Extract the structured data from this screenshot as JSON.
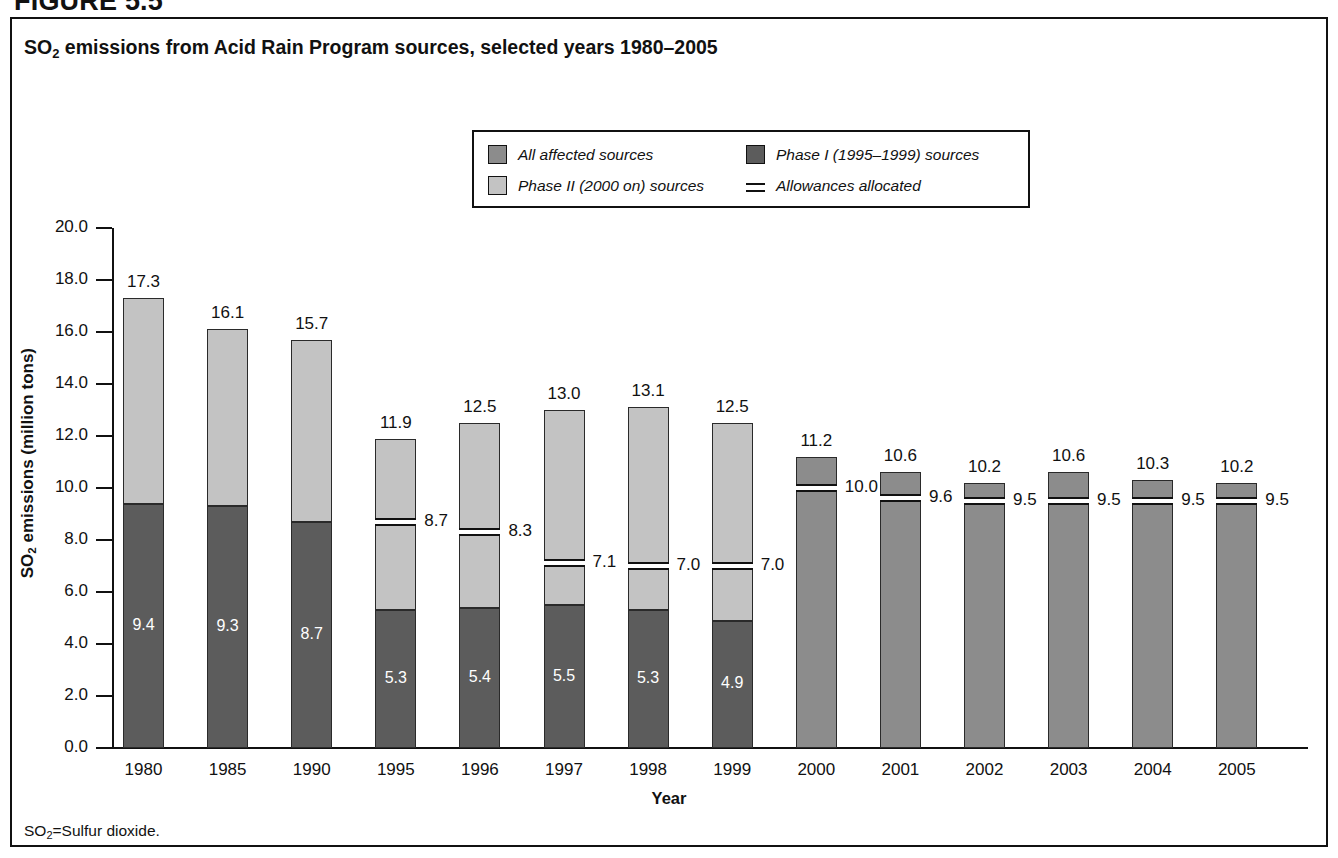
{
  "figure": {
    "number": "FIGURE 5.5"
  },
  "title": {
    "pre": "SO",
    "sub": "2",
    "post": " emissions from Acid Rain Program sources, selected years 1980–2005"
  },
  "legend": {
    "items": [
      {
        "label": "All affected sources",
        "marker": "swatch",
        "color": "#8c8c8c"
      },
      {
        "label": "Phase I (1995–1999) sources",
        "marker": "swatch",
        "color": "#5c5c5c"
      },
      {
        "label": "Phase II (2000 on) sources",
        "marker": "swatch",
        "color": "#c3c3c3"
      },
      {
        "label": "Allowances allocated",
        "marker": "line",
        "color": "#111111"
      }
    ]
  },
  "footnote": {
    "pre": "SO",
    "sub": "2",
    "post": "=Sulfur dioxide."
  },
  "chart_data": {
    "type": "bar",
    "title": "SO2 emissions from Acid Rain Program sources, selected years 1980–2005",
    "xlabel": "Year",
    "ylabel": "SO2 emissions (million tons)",
    "ylim": [
      0.0,
      20.0
    ],
    "ytick_step": 2.0,
    "yticks": [
      "0.0",
      "2.0",
      "4.0",
      "6.0",
      "8.0",
      "10.0",
      "12.0",
      "14.0",
      "16.0",
      "18.0",
      "20.0"
    ],
    "grid": false,
    "legend_position": "top-center",
    "stacked": true,
    "categories": [
      "1980",
      "1985",
      "1990",
      "1995",
      "1996",
      "1997",
      "1998",
      "1999",
      "2000",
      "2001",
      "2002",
      "2003",
      "2004",
      "2005"
    ],
    "series": [
      {
        "name": "Phase I (1995–1999) sources",
        "color": "#5c5c5c",
        "values": [
          9.4,
          9.3,
          8.7,
          5.3,
          5.4,
          5.5,
          5.3,
          4.9,
          null,
          null,
          null,
          null,
          null,
          null
        ]
      },
      {
        "name": "Phase II (2000 on) sources",
        "color": "#c3c3c3",
        "values": [
          7.9,
          6.8,
          7.0,
          6.6,
          7.1,
          7.5,
          7.8,
          7.6,
          null,
          null,
          null,
          null,
          null,
          null
        ]
      },
      {
        "name": "All affected sources",
        "color": "#8c8c8c",
        "values": [
          null,
          null,
          null,
          null,
          null,
          null,
          null,
          null,
          11.2,
          10.6,
          10.2,
          10.6,
          10.3,
          10.2
        ]
      },
      {
        "name": "Allowances allocated",
        "color": "#111111",
        "values": [
          null,
          null,
          null,
          8.7,
          8.3,
          7.1,
          7.0,
          7.0,
          10.0,
          9.6,
          9.5,
          9.5,
          9.5,
          9.5
        ]
      }
    ],
    "totals": [
      17.3,
      16.1,
      15.7,
      11.9,
      12.5,
      13.0,
      13.1,
      12.5,
      11.2,
      10.6,
      10.2,
      10.6,
      10.3,
      10.2
    ],
    "total_labels": [
      "17.3",
      "16.1",
      "15.7",
      "11.9",
      "12.5",
      "13.0",
      "13.1",
      "12.5",
      "11.2",
      "10.6",
      "10.2",
      "10.6",
      "10.3",
      "10.2"
    ],
    "phase1_labels": [
      "9.4",
      "9.3",
      "8.7",
      "5.3",
      "5.4",
      "5.5",
      "5.3",
      "4.9",
      "",
      "",
      "",
      "",
      "",
      ""
    ],
    "allowance_labels": [
      "",
      "",
      "",
      "8.7",
      "8.3",
      "7.1",
      "7.0",
      "7.0",
      "10.0",
      "9.6",
      "9.5",
      "9.5",
      "9.5",
      "9.5"
    ]
  }
}
